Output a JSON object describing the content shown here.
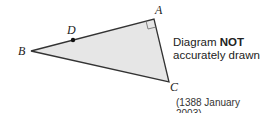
{
  "diagram": {
    "vertices": {
      "A": "A",
      "B": "B",
      "C": "C",
      "D": "D"
    },
    "fill_color": "#e6e6e6",
    "line_color": "#333333",
    "right_angle_at": "A"
  },
  "note": {
    "line1_prefix": "Diagram ",
    "line1_bold": "NOT",
    "line2": "accurately drawn"
  },
  "source": "(1388 January 2003)"
}
